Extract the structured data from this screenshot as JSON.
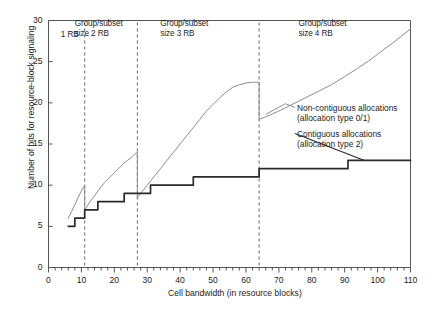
{
  "chart_data": {
    "type": "line",
    "title": "",
    "xlabel": "Cell bandwidth (in resource blocks)",
    "ylabel": "Number of bits for resource-block signaling",
    "xlim": [
      0,
      110
    ],
    "ylim": [
      0,
      30
    ],
    "xticks": [
      0,
      10,
      20,
      30,
      40,
      50,
      60,
      70,
      80,
      90,
      100,
      110
    ],
    "yticks": [
      0,
      5,
      10,
      15,
      20,
      25,
      30
    ],
    "xtick_labels": [
      "0",
      "10",
      "20",
      "30",
      "40",
      "50",
      "60",
      "70",
      "80",
      "90",
      "100",
      "110"
    ],
    "ytick_labels": [
      "0",
      "5",
      "10",
      "15",
      "20",
      "25",
      "30"
    ],
    "minor_xtick_step": 2,
    "grid": false,
    "legend_position": "inside-right",
    "series": [
      {
        "name": "Non-contiguous allocations (allocation type 0/1)",
        "color": "#8c8c8c",
        "style": "staircase",
        "x": [
          6,
          7,
          8,
          9,
          10,
          11,
          11,
          12,
          13,
          14,
          15,
          16,
          17,
          18,
          19,
          20,
          21,
          22,
          23,
          24,
          25,
          26,
          27,
          27,
          28,
          30,
          32,
          34,
          36,
          38,
          40,
          42,
          44,
          46,
          48,
          50,
          52,
          54,
          56,
          58,
          60,
          62,
          64,
          64,
          66,
          70,
          74,
          78,
          82,
          86,
          90,
          94,
          98,
          102,
          106,
          110
        ],
        "y": [
          6.0,
          6.8,
          7.6,
          8.5,
          9.3,
          10.0,
          7.0,
          7.6,
          8.2,
          8.7,
          9.3,
          9.8,
          10.3,
          10.7,
          11.1,
          11.5,
          11.9,
          12.3,
          12.7,
          13.0,
          13.3,
          13.7,
          14.0,
          8.5,
          9.0,
          10.0,
          11.0,
          12.0,
          13.0,
          14.0,
          15.0,
          16.0,
          17.0,
          18.0,
          19.0,
          19.8,
          20.6,
          21.3,
          21.9,
          22.2,
          22.4,
          22.5,
          22.5,
          18.0,
          18.3,
          19.0,
          19.8,
          20.6,
          21.4,
          22.2,
          23.2,
          24.2,
          25.3,
          26.5,
          27.7,
          29.0
        ]
      },
      {
        "name": "Contiguous allocations (allocation type 2)",
        "color": "#2a2a2a",
        "style": "staircase",
        "x": [
          6,
          8,
          8,
          11,
          11,
          15,
          15,
          23,
          23,
          31,
          31,
          44,
          44,
          64,
          64,
          91,
          91,
          110
        ],
        "y": [
          5.0,
          5.0,
          6.0,
          6.0,
          7.0,
          7.0,
          8.0,
          8.0,
          9.0,
          9.0,
          10.0,
          10.0,
          11.0,
          11.0,
          12.0,
          12.0,
          13.0,
          13.0
        ]
      }
    ],
    "region_dividers": [
      11,
      27,
      64
    ],
    "region_labels": [
      {
        "text": "1 RB",
        "x": 8
      },
      {
        "text": "Group/subset\nsize 2 RB",
        "x": 18
      },
      {
        "text": "Group/subset\nsize 3 RB",
        "x": 44
      },
      {
        "text": "Group/subset\nsize 4 RB",
        "x": 86
      }
    ],
    "annotations": [
      {
        "text": "Non-contiguous allocations\n(allocation type 0/1)",
        "x": 75,
        "y": 19.5
      },
      {
        "text": "Contiguous allocations\n(allocation type 2)",
        "x": 75,
        "y": 15.5
      }
    ]
  },
  "labels": {
    "ylabel": "Number of bits for resource-block signaling",
    "xlabel": "Cell bandwidth (in resource blocks)",
    "region_1": "1 RB",
    "region_2_line1": "Group/subset",
    "region_2_line2": "size 2 RB",
    "region_3_line1": "Group/subset",
    "region_3_line2": "size 3 RB",
    "region_4_line1": "Group/subset",
    "region_4_line2": "size 4 RB",
    "legend_1_line1": "Non-contiguous allocations",
    "legend_1_line2": "(allocation type 0/1)",
    "legend_2_line1": "Contiguous allocations",
    "legend_2_line2": "(allocation type 2)"
  },
  "ticks": {
    "y": [
      "30",
      "25",
      "20",
      "15",
      "10",
      "5",
      "0"
    ],
    "x": [
      "0",
      "10",
      "20",
      "30",
      "40",
      "50",
      "60",
      "70",
      "80",
      "90",
      "100",
      "110"
    ]
  },
  "colors": {
    "noncontiguous": "#8c8c8c",
    "contiguous": "#2a2a2a",
    "axis": "#555555",
    "divider": "#666666",
    "text": "#1d1d1d"
  }
}
